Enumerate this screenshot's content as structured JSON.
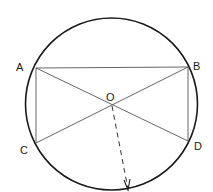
{
  "diagram": {
    "type": "geometry",
    "circle": {
      "cx": 111.5,
      "cy": 104,
      "r": 86
    },
    "points": {
      "A": {
        "label": "A",
        "x": 36,
        "y": 68
      },
      "B": {
        "label": "B",
        "x": 188,
        "y": 67
      },
      "C": {
        "label": "C",
        "x": 36,
        "y": 143
      },
      "D": {
        "label": "D",
        "x": 188,
        "y": 141
      },
      "O": {
        "label": "O",
        "x": 112,
        "y": 105
      }
    },
    "segments": [
      "AB",
      "AC",
      "BD",
      "AD",
      "BC"
    ],
    "radius_arrow": {
      "from": "O",
      "to": {
        "x": 128,
        "y": 190
      },
      "style": "dashed"
    },
    "colors": {
      "stroke": "#1a1a1a",
      "thin": "#555555"
    }
  }
}
